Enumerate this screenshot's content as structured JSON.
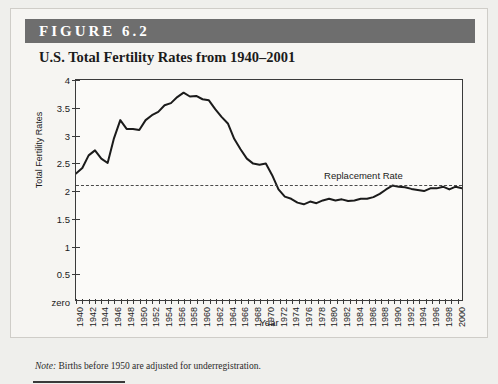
{
  "figure": {
    "banner_label": "FIGURE 6.2",
    "title": "U.S. Total Fertility Rates from 1940–2001",
    "note_prefix": "Note:",
    "note_text": " Births before 1950 are adjusted for underregistration."
  },
  "colors": {
    "banner_background": "#6e6e6e",
    "banner_text": "#ffffff",
    "page_background": "#efefec",
    "figure_background": "#f6f5f2",
    "plot_background": "#fbfaf8",
    "axis": "#3a3a3a",
    "series_line": "#1b1b1b",
    "replacement_line": "#4a4a4a"
  },
  "chart_data": {
    "type": "line",
    "title": "U.S. Total Fertility Rates from 1940–2001",
    "xlabel": "Year",
    "ylabel": "Total Fertility Rates",
    "xlim": [
      1940,
      2001
    ],
    "ylim": [
      0,
      4
    ],
    "grid": false,
    "legend": "none",
    "y_ticks": [
      0,
      0.5,
      1,
      1.5,
      2,
      2.5,
      3,
      3.5,
      4
    ],
    "y_tick_labels": [
      "zero",
      "0.5",
      "1",
      "1.5",
      "2",
      "2.5",
      "3",
      "3.5",
      "4"
    ],
    "x_tick_labels": [
      "1940",
      "1942",
      "1944",
      "1946",
      "1948",
      "1950",
      "1952",
      "1954",
      "1956",
      "1958",
      "1960",
      "1962",
      "1964",
      "1966",
      "1968",
      "1970",
      "1972",
      "1974",
      "1976",
      "1978",
      "1980",
      "1982",
      "1984",
      "1986",
      "1988",
      "1990",
      "1992",
      "1994",
      "1996",
      "1998",
      "2000"
    ],
    "x_tick_step": 2,
    "x_minor_tick_step": 1,
    "annotations": [
      {
        "name": "replacement-rate",
        "label": "Replacement Rate",
        "value": 2.1,
        "style": "dashed-horizontal-line"
      }
    ],
    "series": [
      {
        "name": "Total Fertility Rate",
        "x": [
          1940,
          1941,
          1942,
          1943,
          1944,
          1945,
          1946,
          1947,
          1948,
          1949,
          1950,
          1951,
          1952,
          1953,
          1954,
          1955,
          1956,
          1957,
          1958,
          1959,
          1960,
          1961,
          1962,
          1963,
          1964,
          1965,
          1966,
          1967,
          1968,
          1969,
          1970,
          1971,
          1972,
          1973,
          1974,
          1975,
          1976,
          1977,
          1978,
          1979,
          1980,
          1981,
          1982,
          1983,
          1984,
          1985,
          1986,
          1987,
          1988,
          1989,
          1990,
          1991,
          1992,
          1993,
          1994,
          1995,
          1996,
          1997,
          1998,
          1999,
          2000,
          2001
        ],
        "values": [
          2.3,
          2.4,
          2.63,
          2.72,
          2.57,
          2.49,
          2.94,
          3.27,
          3.11,
          3.11,
          3.09,
          3.27,
          3.36,
          3.42,
          3.54,
          3.58,
          3.69,
          3.77,
          3.7,
          3.71,
          3.65,
          3.63,
          3.47,
          3.33,
          3.21,
          2.93,
          2.74,
          2.57,
          2.48,
          2.46,
          2.48,
          2.27,
          2.01,
          1.88,
          1.84,
          1.77,
          1.74,
          1.79,
          1.76,
          1.81,
          1.84,
          1.81,
          1.83,
          1.8,
          1.81,
          1.84,
          1.84,
          1.87,
          1.93,
          2.01,
          2.08,
          2.06,
          2.05,
          2.02,
          2.0,
          1.98,
          2.03,
          2.03,
          2.06,
          2.01,
          2.06,
          2.03
        ]
      }
    ]
  }
}
